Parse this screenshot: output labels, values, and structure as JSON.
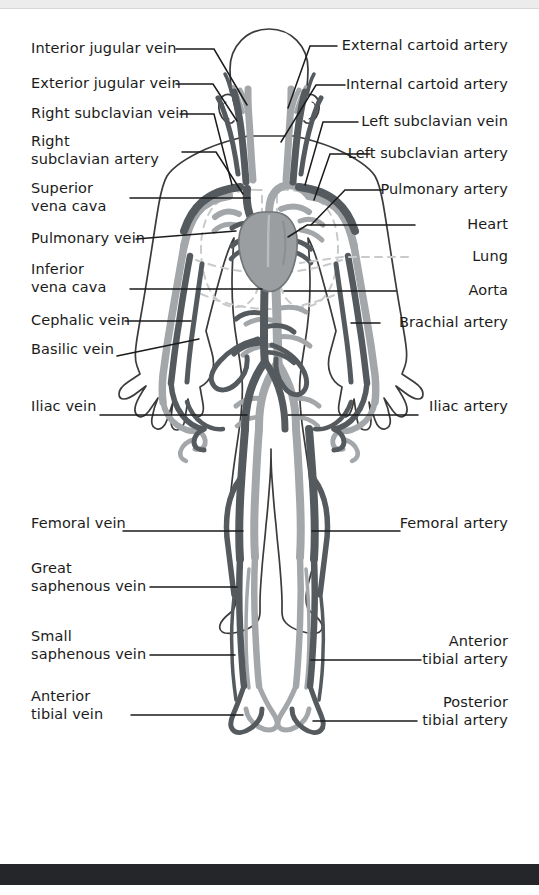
{
  "page": {
    "background_color": "#ffffff",
    "top_bar_color": "#ececec",
    "bottom_bar_color": "#25262a"
  },
  "colors": {
    "vein": "#555a5e",
    "artery": "#a3a7aa",
    "heart": "#9a9ea1",
    "body_outline": "#3b3b3b",
    "lung_dashed": "#c8cacb",
    "leader_line": "#1b1b1b",
    "label_text": "#1b1b1b"
  },
  "labels": {
    "left": [
      {
        "id": "interior-jugular-vein",
        "text": "Interior jugular vein",
        "x": 31,
        "y": 41,
        "lines": 1
      },
      {
        "id": "exterior-jugular-vein",
        "text": "Exterior jugular vein",
        "x": 31,
        "y": 76,
        "lines": 1
      },
      {
        "id": "right-subclavian-vein",
        "text": "Right subclavian vein",
        "x": 31,
        "y": 106,
        "lines": 1
      },
      {
        "id": "right-subclavian-artery",
        "text": "Right\nsubclavian artery",
        "x": 31,
        "y": 134,
        "lines": 2
      },
      {
        "id": "superior-vena-cava",
        "text": "Superior\nvena cava",
        "x": 31,
        "y": 181,
        "lines": 2
      },
      {
        "id": "pulmonary-vein",
        "text": "Pulmonary vein",
        "x": 31,
        "y": 231,
        "lines": 1
      },
      {
        "id": "inferior-vena-cava",
        "text": "Inferior\nvena cava",
        "x": 31,
        "y": 262,
        "lines": 2
      },
      {
        "id": "cephalic-vein",
        "text": "Cephalic vein",
        "x": 31,
        "y": 313,
        "lines": 1
      },
      {
        "id": "basilic-vein",
        "text": "Basilic vein",
        "x": 31,
        "y": 342,
        "lines": 1
      },
      {
        "id": "iliac-vein",
        "text": "Iliac vein",
        "x": 31,
        "y": 399,
        "lines": 1
      },
      {
        "id": "femoral-vein",
        "text": "Femoral vein",
        "x": 31,
        "y": 516,
        "lines": 1
      },
      {
        "id": "great-saphenous-vein",
        "text": "Great\nsaphenous vein",
        "x": 31,
        "y": 561,
        "lines": 2
      },
      {
        "id": "small-saphenous-vein",
        "text": "Small\nsaphenous vein",
        "x": 31,
        "y": 629,
        "lines": 2
      },
      {
        "id": "anterior-tibial-vein",
        "text": "Anterior\ntibial vein",
        "x": 31,
        "y": 689,
        "lines": 2
      }
    ],
    "right": [
      {
        "id": "external-cartoid-artery",
        "text": "External cartoid artery",
        "right": 31,
        "y": 38,
        "lines": 1
      },
      {
        "id": "internal-cartoid-artery",
        "text": "Internal cartoid artery",
        "right": 31,
        "y": 77,
        "lines": 1
      },
      {
        "id": "left-subclavian-vein",
        "text": "Left subclavian vein",
        "right": 31,
        "y": 114,
        "lines": 1
      },
      {
        "id": "left-subclavian-artery",
        "text": "Left subclavian artery",
        "right": 31,
        "y": 146,
        "lines": 1
      },
      {
        "id": "pulmonary-artery",
        "text": "Pulmonary artery",
        "right": 31,
        "y": 182,
        "lines": 1
      },
      {
        "id": "heart",
        "text": "Heart",
        "right": 31,
        "y": 217,
        "lines": 1
      },
      {
        "id": "lung",
        "text": "Lung",
        "right": 31,
        "y": 249,
        "lines": 1
      },
      {
        "id": "aorta",
        "text": "Aorta",
        "right": 31,
        "y": 283,
        "lines": 1
      },
      {
        "id": "brachial-artery",
        "text": "Brachial artery",
        "right": 31,
        "y": 315,
        "lines": 1
      },
      {
        "id": "iliac-artery",
        "text": "Iliac artery",
        "right": 31,
        "y": 399,
        "lines": 1
      },
      {
        "id": "femoral-artery",
        "text": "Femoral artery",
        "right": 31,
        "y": 516,
        "lines": 1
      },
      {
        "id": "anterior-tibial-artery",
        "text": "Anterior\ntibial artery",
        "right": 31,
        "y": 634,
        "lines": 2
      },
      {
        "id": "posterior-tibial-artery",
        "text": "Posterior\ntibial artery",
        "right": 31,
        "y": 695,
        "lines": 2
      }
    ]
  }
}
